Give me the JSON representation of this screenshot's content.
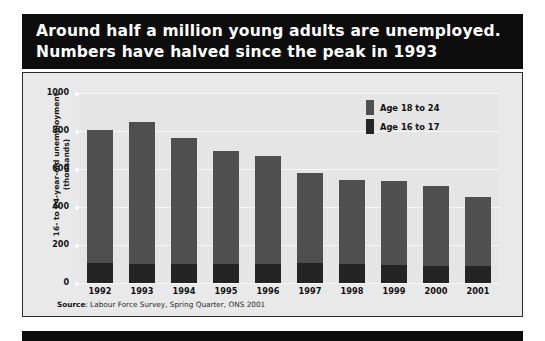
{
  "title": {
    "line1": "Around half a million young adults are unemployed.",
    "line2": "Numbers have halved since the peak in 1993"
  },
  "source": {
    "prefix": "Source",
    "text": ": Labour Force Survey, Spring Quarter, ONS 2001"
  },
  "colors": {
    "banner_background": "#0d0d0d",
    "plot_background": "#e5e5e5",
    "series_18_to_24": "#4f4f4f",
    "series_16_to_17": "#242424",
    "gridline": "#f7f7f7",
    "frame_border": "#2b2b2b"
  },
  "chart_data": {
    "type": "bar",
    "stacked": true,
    "title": "Around half a million young adults are unemployed. Numbers have halved since the peak in 1993",
    "xlabel": "",
    "ylabel": "16- to 24-year-old unemployment (thousands)",
    "ylim": [
      0,
      1000
    ],
    "yticks": [
      0,
      200,
      400,
      600,
      800,
      1000
    ],
    "ytick_labels": [
      "0",
      "200",
      "400",
      "600",
      "800",
      "1000"
    ],
    "grid": true,
    "legend_position": "top-right",
    "categories": [
      "1992",
      "1993",
      "1994",
      "1995",
      "1996",
      "1997",
      "1998",
      "1999",
      "2000",
      "2001"
    ],
    "series": [
      {
        "name": "Age 16 to 17",
        "color": "#242424",
        "values": [
          105,
          100,
          100,
          100,
          100,
          105,
          100,
          95,
          90,
          90
        ]
      },
      {
        "name": "Age 18 to 24",
        "color": "#4f4f4f",
        "values": [
          700,
          750,
          665,
          595,
          570,
          475,
          440,
          440,
          420,
          365
        ]
      }
    ],
    "totals": [
      805,
      850,
      765,
      695,
      670,
      580,
      540,
      535,
      510,
      455
    ]
  },
  "yaxis": {
    "title_line1": "16- to 24-year-old unemployment",
    "title_line2": "(thousands)"
  },
  "legend": {
    "items": [
      {
        "label": "Age 18 to 24",
        "color": "#4f4f4f"
      },
      {
        "label": "Age 16 to 17",
        "color": "#242424"
      }
    ]
  }
}
